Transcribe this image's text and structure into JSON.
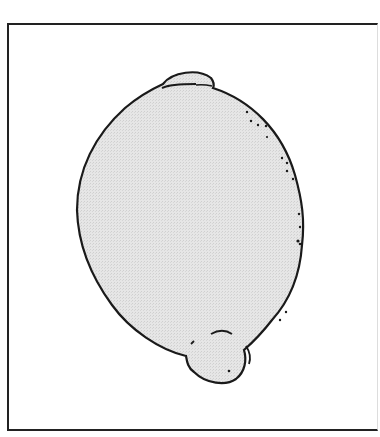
{
  "illustration": {
    "subject": "lemon",
    "style": "line drawing with light gray stippled fill",
    "colors": {
      "fill": "#e2e2e2",
      "outline": "#1a1a1a",
      "background": "#ffffff",
      "frame": "#222222"
    }
  }
}
